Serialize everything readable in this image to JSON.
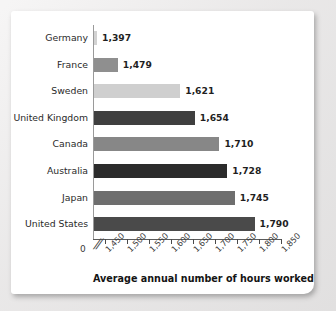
{
  "chart_data": {
    "type": "bar",
    "orientation": "horizontal",
    "title": "",
    "xlabel": "Average annual number of hours worked",
    "ylabel": "",
    "categories": [
      "Germany",
      "France",
      "Sweden",
      "United Kingdom",
      "Canada",
      "Australia",
      "Japan",
      "United States"
    ],
    "values": [
      1397,
      1479,
      1621,
      1654,
      1710,
      1728,
      1745,
      1790
    ],
    "value_labels": [
      "1,397",
      "1,479",
      "1,621",
      "1,654",
      "1,710",
      "1,728",
      "1,745",
      "1,790"
    ],
    "bar_colors": [
      "#d2d2d2",
      "#8f8f8f",
      "#cfcfcf",
      "#3f3f3f",
      "#878787",
      "#2b2b2b",
      "#6e6e6e",
      "#4a4a4a"
    ],
    "xlim": [
      1425,
      1850
    ],
    "xticks": [
      1450,
      1500,
      1550,
      1600,
      1650,
      1700,
      1750,
      1800,
      1850
    ],
    "xtick_labels": [
      "1,450",
      "1,500",
      "1,550",
      "1,600",
      "1,650",
      "1,700",
      "1,750",
      "1,800",
      "1,850"
    ],
    "origin_label": "0",
    "axis_break": "//",
    "grid": false,
    "legend": null,
    "tick_label_rotation": -45
  },
  "figure": {
    "panel_background": "#ffffff",
    "page_background": "#eceaea",
    "axis_color": "#4a4a4a"
  }
}
